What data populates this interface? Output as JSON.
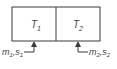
{
  "diagram": {
    "type": "two-tank system",
    "colors": {
      "stroke": "#3a3a3a",
      "text": "#444444",
      "background": "#ffffff"
    },
    "tanks": [
      {
        "label": "T",
        "subscript": "1"
      },
      {
        "label": "T",
        "subscript": "2"
      }
    ],
    "inputs": [
      {
        "var1": "m",
        "sub1": "1",
        "sep": ",",
        "var2": "s",
        "sub2": "1",
        "target": "T1"
      },
      {
        "var1": "m",
        "sub1": "2",
        "sep": ",",
        "var2": "s",
        "sub2": "2",
        "target": "T2"
      }
    ]
  }
}
